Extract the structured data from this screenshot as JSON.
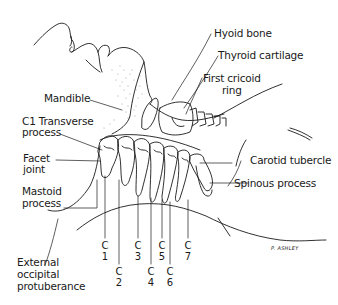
{
  "diagram": {
    "labels": {
      "hyoid_bone": "Hyoid bone",
      "thyroid_cartilage": "Thyroid cartilage",
      "first_cricoid_ring_line1": "First cricoid",
      "first_cricoid_ring_line2": "ring",
      "mandible": "Mandible",
      "c1_transverse_line1": "C1 Transverse",
      "c1_transverse_line2": "process",
      "facet_joint_line1": "Facet",
      "facet_joint_line2": "joint",
      "carotid_tubercle": "Carotid tubercle",
      "mastoid_line1": "Mastoid",
      "mastoid_line2": "process",
      "spinous_process": "Spinous process",
      "external_occipital_line1": "External",
      "external_occipital_line2": "occipital",
      "external_occipital_line3": "protuberance"
    },
    "vertebrae": [
      {
        "letter": "C",
        "number": "1"
      },
      {
        "letter": "C",
        "number": "2"
      },
      {
        "letter": "C",
        "number": "3"
      },
      {
        "letter": "C",
        "number": "4"
      },
      {
        "letter": "C",
        "number": "5"
      },
      {
        "letter": "C",
        "number": "6"
      },
      {
        "letter": "C",
        "number": "7"
      }
    ],
    "signature": "P. ASHLEY"
  }
}
